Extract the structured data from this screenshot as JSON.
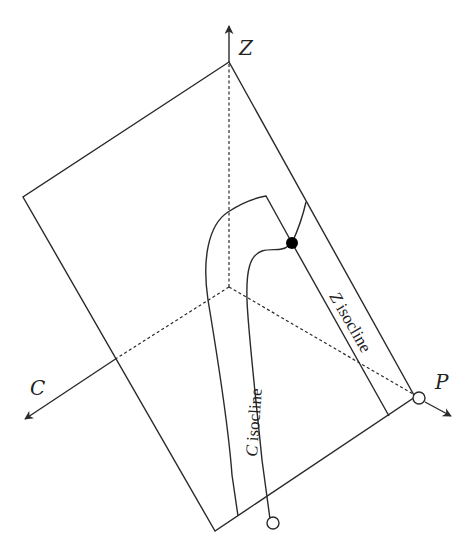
{
  "diagram": {
    "axes": {
      "z": {
        "label": "Z"
      },
      "c": {
        "label": "C"
      },
      "p": {
        "label": "P"
      }
    },
    "curves": {
      "c_isocline": {
        "label": "C isocline",
        "label_var": "C",
        "label_text": " isocline"
      },
      "z_isocline": {
        "label": "Z isocline",
        "label_var": "Z",
        "label_text": " isocline"
      }
    },
    "points": {
      "intersection": {
        "type": "filled",
        "color": "#000000"
      },
      "p_axis_equilibrium": {
        "type": "open"
      },
      "plane_edge_equilibrium": {
        "type": "open"
      }
    },
    "colors": {
      "stroke": "#2a2a2a",
      "background": "#ffffff"
    }
  }
}
